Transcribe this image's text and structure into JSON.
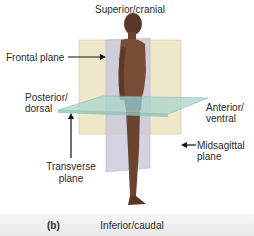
{
  "figure": {
    "panel_label": "(b)",
    "directions": {
      "top": "Superior/cranial",
      "bottom": "Inferior/caudal",
      "left_line1": "Posterior/",
      "left_line2": "dorsal",
      "right_line1": "Anterior/",
      "right_line2": "ventral"
    },
    "planes": {
      "frontal": "Frontal plane",
      "transverse_line1": "Transverse",
      "transverse_line2": "plane",
      "midsagittal_line1": "Midsagittal",
      "midsagittal_line2": "plane"
    },
    "colors": {
      "frontal_plane": "#efe6c8",
      "midsagittal_plane": "#c9c9dd",
      "transverse_plane": "#a9d6cc",
      "skin": "#6b4430",
      "briefs": "#2c3565",
      "arrow": "#111111"
    }
  }
}
